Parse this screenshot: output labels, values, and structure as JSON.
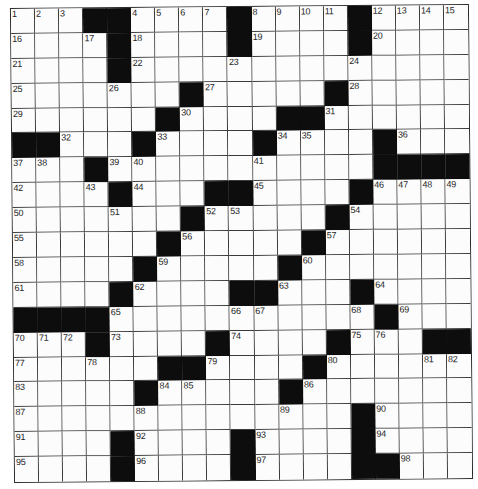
{
  "puzzle": {
    "size": {
      "rows": 19,
      "cols": 19
    },
    "colors": {
      "block": "#0d0d0d",
      "cell": "#fcfcfc",
      "line": "#3a3a3a",
      "number": "#1e1e1e"
    },
    "legend": {
      "#": "black-square",
      "": "empty-white-square",
      "n": "numbered-white-square"
    },
    "rows": [
      [
        "1",
        "2",
        "3",
        "#",
        "#",
        "4",
        "5",
        "6",
        "7",
        "#",
        "8",
        "9",
        "10",
        "11",
        "#",
        "12",
        "13",
        "14",
        "15"
      ],
      [
        "16",
        "",
        "",
        "17",
        "#",
        "18",
        "",
        "",
        "",
        "#",
        "19",
        "",
        "",
        "",
        "#",
        "20",
        "",
        "",
        ""
      ],
      [
        "21",
        "",
        "",
        "",
        "#",
        "22",
        "",
        "",
        "",
        "23",
        "",
        "",
        "",
        "",
        "24",
        "",
        "",
        "",
        ""
      ],
      [
        "25",
        "",
        "",
        "",
        "26",
        "",
        "",
        "#",
        "27",
        "",
        "",
        "",
        "",
        "#",
        "28",
        "",
        "",
        "",
        ""
      ],
      [
        "29",
        "",
        "",
        "",
        "",
        "",
        "#",
        "30",
        "",
        "",
        "",
        "#",
        "#",
        "31",
        "",
        "",
        "",
        "",
        ""
      ],
      [
        "#",
        "#",
        "32",
        "",
        "",
        "#",
        "33",
        "",
        "",
        "",
        "#",
        "34",
        "35",
        "",
        "",
        "#",
        "36",
        "",
        ""
      ],
      [
        "37",
        "38",
        "",
        "#",
        "39",
        "40",
        "",
        "",
        "",
        "",
        "41",
        "",
        "",
        "",
        "",
        "#",
        "#",
        "#",
        "#"
      ],
      [
        "42",
        "",
        "",
        "43",
        "#",
        "44",
        "",
        "",
        "#",
        "#",
        "45",
        "",
        "",
        "",
        "#",
        "46",
        "47",
        "48",
        "49"
      ],
      [
        "50",
        "",
        "",
        "",
        "51",
        "",
        "",
        "#",
        "52",
        "53",
        "",
        "",
        "",
        "#",
        "54",
        "",
        "",
        "",
        ""
      ],
      [
        "55",
        "",
        "",
        "",
        "",
        "",
        "#",
        "56",
        "",
        "",
        "",
        "",
        "#",
        "57",
        "",
        "",
        "",
        "",
        ""
      ],
      [
        "58",
        "",
        "",
        "",
        "",
        "#",
        "59",
        "",
        "",
        "",
        "",
        "#",
        "60",
        "",
        "",
        "",
        "",
        "",
        ""
      ],
      [
        "61",
        "",
        "",
        "",
        "#",
        "62",
        "",
        "",
        "",
        "#",
        "#",
        "63",
        "",
        "",
        "#",
        "64",
        "",
        "",
        ""
      ],
      [
        "#",
        "#",
        "#",
        "#",
        "65",
        "",
        "",
        "",
        "",
        "66",
        "67",
        "",
        "",
        "",
        "68",
        "#",
        "69",
        "",
        ""
      ],
      [
        "70",
        "71",
        "72",
        "#",
        "73",
        "",
        "",
        "",
        "#",
        "74",
        "",
        "",
        "",
        "#",
        "75",
        "76",
        "",
        "#",
        "#"
      ],
      [
        "77",
        "",
        "",
        "78",
        "",
        "",
        "#",
        "#",
        "79",
        "",
        "",
        "",
        "#",
        "80",
        "",
        "",
        "",
        "81",
        "82"
      ],
      [
        "83",
        "",
        "",
        "",
        "",
        "#",
        "84",
        "85",
        "",
        "",
        "",
        "#",
        "86",
        "",
        "",
        "",
        "",
        "",
        ""
      ],
      [
        "87",
        "",
        "",
        "",
        "",
        "88",
        "",
        "",
        "",
        "",
        "",
        "89",
        "",
        "",
        "#",
        "90",
        "",
        "",
        ""
      ],
      [
        "91",
        "",
        "",
        "",
        "#",
        "92",
        "",
        "",
        "",
        "#",
        "93",
        "",
        "",
        "",
        "#",
        "94",
        "",
        "",
        ""
      ],
      [
        "95",
        "",
        "",
        "",
        "#",
        "96",
        "",
        "",
        "",
        "#",
        "97",
        "",
        "",
        "",
        "#",
        "#",
        "98",
        "",
        ""
      ]
    ]
  }
}
